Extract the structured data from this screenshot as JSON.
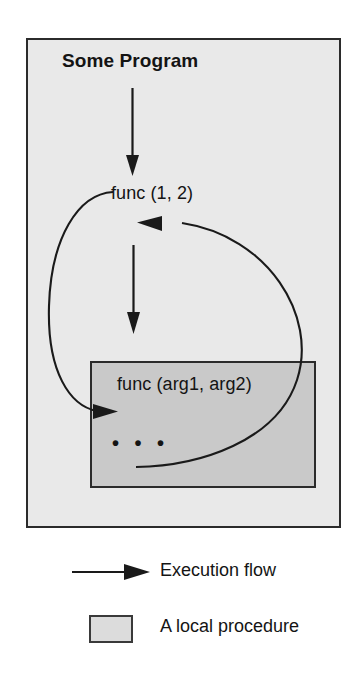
{
  "diagram": {
    "title_text": "Some Program",
    "caller_label": "func (1, 2)",
    "callee_label": "func (arg1, arg2)",
    "body_ellipsis": "• • •",
    "program_box_name": "Some Program",
    "procedure_box_name": "local procedure"
  },
  "colors": {
    "program_box_fill": "#e9e9e9",
    "procedure_box_fill": "#c9c9c9",
    "stroke": "#2b2b2b",
    "text": "#141414",
    "page_background": "#ffffff",
    "legend_swatch_fill": "#dcdcdc"
  },
  "legend": {
    "items": [
      {
        "symbol": "arrow",
        "label": "Execution flow"
      },
      {
        "symbol": "shaded-rectangle",
        "label": "A local procedure"
      }
    ]
  },
  "flow": {
    "steps": [
      "Some Program",
      "func (1, 2)",
      "func (arg1, arg2)"
    ],
    "arrows": [
      {
        "name": "program-to-call",
        "from": "Some Program",
        "to": "func (1, 2)",
        "kind": "straight-down"
      },
      {
        "name": "call-to-body",
        "from": "func (1, 2)",
        "to": "procedure body",
        "kind": "straight-down"
      },
      {
        "name": "call-into-procedure",
        "from": "func (1, 2)",
        "to": "func (arg1, arg2)",
        "kind": "curve-left"
      },
      {
        "name": "return-to-caller",
        "from": "func (arg1, arg2)",
        "to": "func (1, 2)",
        "kind": "curve-right"
      }
    ]
  }
}
